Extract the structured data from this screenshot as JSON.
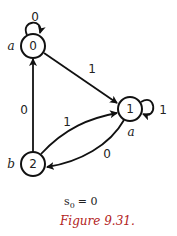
{
  "diagram": {
    "type": "state-machine",
    "nodes": [
      {
        "id": "0",
        "label": "0",
        "output": "a",
        "cx": 33,
        "cy": 46
      },
      {
        "id": "1",
        "label": "1",
        "output": "a",
        "cx": 130,
        "cy": 109
      },
      {
        "id": "2",
        "label": "2",
        "output": "b",
        "cx": 33,
        "cy": 164
      }
    ],
    "edges": [
      {
        "from": "0",
        "to": "0",
        "label": "0"
      },
      {
        "from": "0",
        "to": "1",
        "label": "1"
      },
      {
        "from": "1",
        "to": "1",
        "label": "1"
      },
      {
        "from": "1",
        "to": "2",
        "label": "0"
      },
      {
        "from": "2",
        "to": "0",
        "label": "0"
      },
      {
        "from": "2",
        "to": "1",
        "label": "1"
      }
    ],
    "initial_state_label": "s",
    "initial_state_sub": "0",
    "initial_state_value": "= 0",
    "caption": "Figure 9.31.",
    "caption_color": "#b22222"
  }
}
